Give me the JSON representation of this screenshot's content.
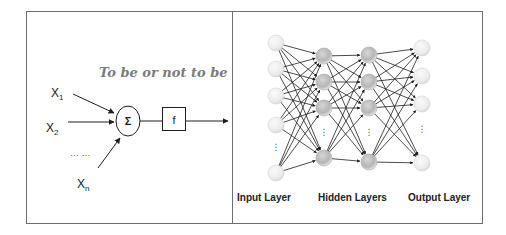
{
  "colors": {
    "border": "#6e6e6e",
    "stroke": "#1e1e1e",
    "caption": "#7b7b7b",
    "label": "#222222",
    "hidden_node_fill": "#bcbcbc",
    "io_node_fill": "#f2f2f2"
  },
  "left_panel": {
    "caption": "To be or not to be",
    "inputs": [
      {
        "base": "X",
        "sub": "1"
      },
      {
        "base": "X",
        "sub": "2"
      },
      {
        "base": "X",
        "sub": "n"
      }
    ],
    "ellipsis": "… …",
    "sum_symbol": "Σ",
    "activation_label": "f"
  },
  "right_panel": {
    "labels": {
      "input": "Input Layer",
      "hidden": "Hidden Layers",
      "output": "Output Layer"
    },
    "vertical_ellipsis": "⋮",
    "layers": {
      "input": {
        "x": 276,
        "ys": [
          43,
          69,
          96,
          125,
          173
        ],
        "ellipsis_y": 150
      },
      "hidden1": {
        "x": 324,
        "ys": [
          56,
          82,
          108,
          158
        ],
        "ellipsis_y": 135
      },
      "hidden2": {
        "x": 369,
        "ys": [
          55,
          82,
          108,
          162
        ],
        "ellipsis_y": 135
      },
      "output": {
        "x": 422,
        "ys": [
          48,
          76,
          104,
          163
        ],
        "ellipsis_y": 132
      }
    }
  }
}
